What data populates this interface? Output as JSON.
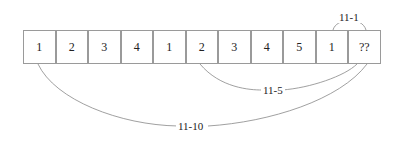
{
  "diagram": {
    "cells": [
      "1",
      "2",
      "3",
      "4",
      "1",
      "2",
      "3",
      "4",
      "5",
      "1",
      "??"
    ],
    "arcs": [
      {
        "label": "11-1",
        "from_index": 9,
        "to_index": 10,
        "side": "top"
      },
      {
        "label": "11-5",
        "from_index": 5,
        "to_index": 10,
        "side": "bottom"
      },
      {
        "label": "11-10",
        "from_index": 0,
        "to_index": 10,
        "side": "bottom"
      }
    ]
  }
}
